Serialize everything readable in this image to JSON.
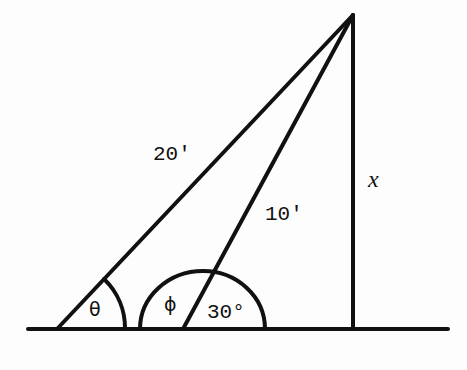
{
  "diagram": {
    "type": "right-triangle-geometry",
    "labels": {
      "hypotenuse_long": "20'",
      "hypotenuse_short": "10'",
      "height": "x",
      "angle_left": "θ",
      "angle_mid_left": "ϕ",
      "angle_mid_right": "30°"
    },
    "stroke_color": "#111111",
    "background": "#fdfdfd"
  }
}
